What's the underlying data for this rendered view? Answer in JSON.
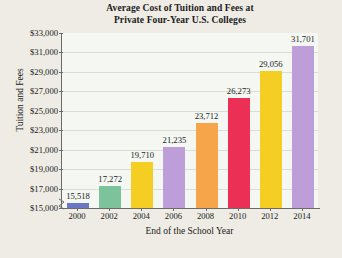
{
  "chart_data": {
    "type": "bar",
    "title": "Average Cost of Tuition and Fees at Private Four-Year U.S. Colleges",
    "title_line1": "Average Cost of Tuition and Fees at",
    "title_line2": "Private Four-Year U.S. Colleges",
    "xlabel": "End of the School Year",
    "ylabel": "Tuition and Fees",
    "categories": [
      "2000",
      "2002",
      "2004",
      "2006",
      "2008",
      "2010",
      "2012",
      "2014"
    ],
    "values": [
      15518,
      17272,
      19710,
      21235,
      23712,
      26273,
      29056,
      31701
    ],
    "value_labels": [
      "15,518",
      "17,272",
      "19,710",
      "21,235",
      "23,712",
      "26,273",
      "29,056",
      "31,701"
    ],
    "bar_colors": [
      "#6b77c4",
      "#7cc39c",
      "#f5ce23",
      "#bd9ed8",
      "#f6a54a",
      "#ec2f55",
      "#f5ce23",
      "#bd9ed8"
    ],
    "ylim": [
      15000,
      33000
    ],
    "ytick_values": [
      15000,
      17000,
      19000,
      21000,
      23000,
      25000,
      27000,
      29000,
      31000,
      33000
    ],
    "ytick_labels": [
      "$15,000",
      "$17,000",
      "$19,000",
      "$21,000",
      "$23,000",
      "$25,000",
      "$27,000",
      "$29,000",
      "$31,000",
      "$33,000"
    ],
    "grid": true,
    "legend": "none",
    "axis_break": true,
    "axis_break_icon": "y-axis-break-zigzag"
  }
}
